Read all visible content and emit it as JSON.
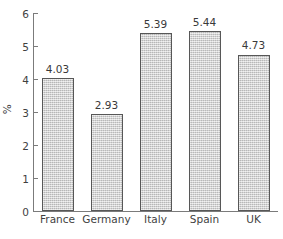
{
  "chart_data": {
    "type": "bar",
    "title": "",
    "xlabel": "",
    "ylabel": "%",
    "categories": [
      "France",
      "Germany",
      "Italy",
      "Spain",
      "UK"
    ],
    "values": [
      4.03,
      2.93,
      5.39,
      5.44,
      4.73
    ],
    "value_labels": [
      "4.03",
      "2.93",
      "5.39",
      "5.44",
      "4.73"
    ],
    "ylim": [
      0,
      6
    ],
    "yticks": [
      0,
      1,
      2,
      3,
      4,
      5,
      6
    ],
    "ytick_labels": [
      "0",
      "1",
      "2",
      "3",
      "4",
      "5",
      "6"
    ],
    "grid": false,
    "legend": false,
    "bar_fill_color": "#c9c9c9",
    "bar_border_color": "#575757",
    "axis_color": "#7b7b7b",
    "background_color": "#ffffff"
  }
}
